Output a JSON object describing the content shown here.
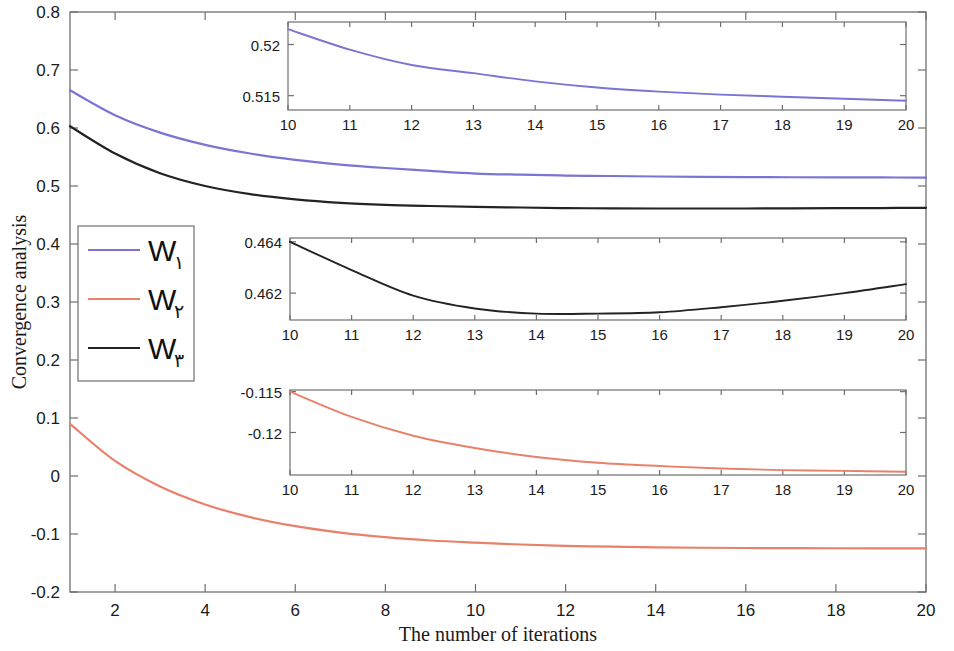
{
  "chart_data": {
    "type": "line",
    "title": "",
    "xlabel": "The number of iterations",
    "ylabel": "Convergence analysis",
    "xlim": [
      1,
      20
    ],
    "ylim": [
      -0.2,
      0.8
    ],
    "grid": false,
    "legend_position": "center-left",
    "x_ticks": [
      2,
      4,
      6,
      8,
      10,
      12,
      14,
      16,
      18,
      20
    ],
    "x_tick_labels": [
      "2",
      "4",
      "6",
      "8",
      "10",
      "12",
      "14",
      "16",
      "18",
      "20"
    ],
    "y_ticks": [
      -0.2,
      -0.1,
      0,
      0.1,
      0.2,
      0.3,
      0.4,
      0.5,
      0.6,
      0.7,
      0.8
    ],
    "y_tick_labels": [
      "-0.2",
      "-0.1",
      "0",
      "0.1",
      "0.2",
      "0.3",
      "0.4",
      "0.5",
      "0.6",
      "0.7",
      "0.8"
    ],
    "x": [
      1,
      2,
      3,
      4,
      5,
      6,
      7,
      8,
      9,
      10,
      11,
      12,
      13,
      14,
      15,
      16,
      17,
      18,
      19,
      20
    ],
    "series": [
      {
        "name": "W١",
        "color": "#7b74d4",
        "values": [
          0.665,
          0.622,
          0.592,
          0.571,
          0.556,
          0.545,
          0.537,
          0.531,
          0.526,
          0.5215,
          0.5195,
          0.518,
          0.5172,
          0.5164,
          0.5158,
          0.5154,
          0.5151,
          0.5149,
          0.5147,
          0.5145
        ]
      },
      {
        "name": "W٢",
        "color": "#e8806b",
        "values": [
          0.09,
          0.026,
          -0.018,
          -0.049,
          -0.071,
          -0.0865,
          -0.0975,
          -0.1055,
          -0.1112,
          -0.115,
          -0.1181,
          -0.1204,
          -0.1219,
          -0.123,
          -0.1237,
          -0.1241,
          -0.1244,
          -0.1246,
          -0.1247,
          -0.1248
        ]
      },
      {
        "name": "W٣",
        "color": "#232323",
        "values": [
          0.603,
          0.556,
          0.522,
          0.5,
          0.486,
          0.477,
          0.471,
          0.4675,
          0.4655,
          0.464,
          0.4629,
          0.4619,
          0.4614,
          0.4612,
          0.4612,
          0.46125,
          0.46145,
          0.4617,
          0.462,
          0.46235
        ]
      }
    ],
    "legend": [
      {
        "label": "W",
        "subscript": "١",
        "color": "#7b74d4"
      },
      {
        "label": "W",
        "subscript": "٢",
        "color": "#e8806b"
      },
      {
        "label": "W",
        "subscript": "٣",
        "color": "#232323"
      }
    ],
    "insets": [
      {
        "id": "inset-w1",
        "series_name": "W١",
        "color": "#7b74d4",
        "xlim": [
          10,
          20
        ],
        "ylim": [
          0.5136,
          0.5222
        ],
        "x_ticks": [
          10,
          11,
          12,
          13,
          14,
          15,
          16,
          17,
          18,
          19,
          20
        ],
        "x_tick_labels": [
          "10",
          "11",
          "12",
          "13",
          "14",
          "15",
          "16",
          "17",
          "18",
          "19",
          "20"
        ],
        "y_ticks": [
          0.515,
          0.52
        ],
        "y_tick_labels": [
          "0.515",
          "0.52"
        ],
        "x": [
          10,
          11,
          12,
          13,
          14,
          15,
          16,
          17,
          18,
          19,
          20
        ],
        "values": [
          0.5215,
          0.5195,
          0.518,
          0.5172,
          0.5164,
          0.5158,
          0.5154,
          0.5151,
          0.5149,
          0.5147,
          0.5145
        ]
      },
      {
        "id": "inset-w3",
        "series_name": "W٣",
        "color": "#232323",
        "xlim": [
          10,
          20
        ],
        "ylim": [
          0.46095,
          0.46415
        ],
        "x_ticks": [
          10,
          11,
          12,
          13,
          14,
          15,
          16,
          17,
          18,
          19,
          20
        ],
        "x_tick_labels": [
          "10",
          "11",
          "12",
          "13",
          "14",
          "15",
          "16",
          "17",
          "18",
          "19",
          "20"
        ],
        "y_ticks": [
          0.462,
          0.464
        ],
        "y_tick_labels": [
          "0.462",
          "0.464"
        ],
        "x": [
          10,
          11,
          12,
          13,
          14,
          15,
          16,
          17,
          18,
          19,
          20
        ],
        "values": [
          0.464,
          0.4629,
          0.4619,
          0.4614,
          0.4612,
          0.4612,
          0.46125,
          0.46145,
          0.4617,
          0.462,
          0.46235
        ]
      },
      {
        "id": "inset-w2",
        "series_name": "W٢",
        "color": "#e8806b",
        "xlim": [
          10,
          20
        ],
        "ylim": [
          -0.1252,
          -0.1148
        ],
        "x_ticks": [
          10,
          11,
          12,
          13,
          14,
          15,
          16,
          17,
          18,
          19,
          20
        ],
        "x_tick_labels": [
          "10",
          "11",
          "12",
          "13",
          "14",
          "15",
          "16",
          "17",
          "18",
          "19",
          "20"
        ],
        "y_ticks": [
          -0.12,
          -0.115
        ],
        "y_tick_labels": [
          "-0.12",
          "-0.115"
        ],
        "x": [
          10,
          11,
          12,
          13,
          14,
          15,
          16,
          17,
          18,
          19,
          20
        ],
        "values": [
          -0.115,
          -0.1181,
          -0.1204,
          -0.1219,
          -0.123,
          -0.1237,
          -0.1241,
          -0.1244,
          -0.1246,
          -0.1247,
          -0.1248
        ]
      }
    ]
  }
}
